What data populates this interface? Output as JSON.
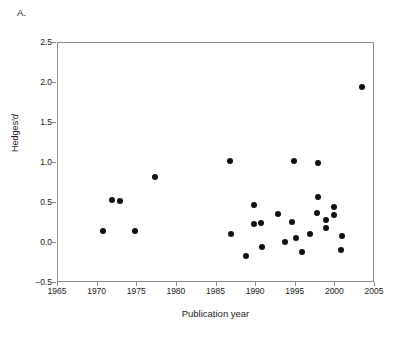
{
  "panel": {
    "label": "A."
  },
  "chart_data": {
    "type": "scatter",
    "title": "",
    "xlabel": "Publication year",
    "ylabel": "Hedges' d",
    "ylabel_plain": "Hedges'",
    "ylabel_italic": "d",
    "xlim": [
      1965,
      2005
    ],
    "ylim": [
      -0.5,
      2.5
    ],
    "xticks": [
      1965,
      1970,
      1975,
      1980,
      1985,
      1990,
      1995,
      2000,
      2005
    ],
    "xticklabels": [
      "1965",
      "1970",
      "1975",
      "1980",
      "1985",
      "1990",
      "1995",
      "2000",
      "2005"
    ],
    "yticks": [
      -0.5,
      0.0,
      0.5,
      1.0,
      1.5,
      2.0,
      2.5
    ],
    "yticklabels": [
      "−0.5",
      "0.0",
      "0.5",
      "1.0",
      "1.5",
      "2.0",
      "2.5"
    ],
    "grid": false,
    "legend": null,
    "marker": {
      "shape": "circle",
      "color": "#111111",
      "size": 6
    },
    "points": [
      {
        "x": 1970.8,
        "y": 0.14
      },
      {
        "x": 1971.9,
        "y": 0.53
      },
      {
        "x": 1973.0,
        "y": 0.51
      },
      {
        "x": 1974.9,
        "y": 0.14
      },
      {
        "x": 1977.4,
        "y": 0.81
      },
      {
        "x": 1986.8,
        "y": 1.01
      },
      {
        "x": 1986.9,
        "y": 0.1
      },
      {
        "x": 1988.9,
        "y": -0.17
      },
      {
        "x": 1989.9,
        "y": 0.46
      },
      {
        "x": 1989.9,
        "y": 0.22
      },
      {
        "x": 1990.8,
        "y": 0.24
      },
      {
        "x": 1990.9,
        "y": -0.06
      },
      {
        "x": 1992.9,
        "y": 0.35
      },
      {
        "x": 1993.8,
        "y": 0.0
      },
      {
        "x": 1994.7,
        "y": 0.25
      },
      {
        "x": 1994.9,
        "y": 1.01
      },
      {
        "x": 1995.1,
        "y": 0.05
      },
      {
        "x": 1995.9,
        "y": -0.13
      },
      {
        "x": 1996.9,
        "y": 0.1
      },
      {
        "x": 1997.9,
        "y": 0.99
      },
      {
        "x": 1997.9,
        "y": 0.56
      },
      {
        "x": 1997.8,
        "y": 0.36
      },
      {
        "x": 1998.9,
        "y": 0.28
      },
      {
        "x": 1998.9,
        "y": 0.18
      },
      {
        "x": 1999.9,
        "y": 0.44
      },
      {
        "x": 1999.9,
        "y": 0.34
      },
      {
        "x": 2000.9,
        "y": 0.08
      },
      {
        "x": 2000.8,
        "y": -0.1
      },
      {
        "x": 2003.5,
        "y": 1.94
      }
    ]
  },
  "colors": {
    "marker": "#111111",
    "axis": "#8c8c8c",
    "text": "#1a1a1a",
    "background": "#ffffff"
  }
}
